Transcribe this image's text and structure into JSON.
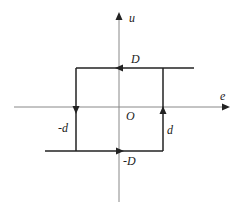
{
  "diagram": {
    "type": "relay-hysteresis",
    "axes": {
      "x_label": "e",
      "y_label": "u",
      "origin_label": "O"
    },
    "labels": {
      "upper_level": "D",
      "lower_level": "-D",
      "right_threshold": "d",
      "left_threshold": "-d"
    },
    "colors": {
      "axis": "#888888",
      "loop": "#222222",
      "background": "#ffffff"
    }
  }
}
